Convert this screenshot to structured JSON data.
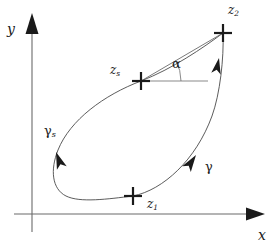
{
  "figure": {
    "background": "#ffffff",
    "ink": "#1a1a1a",
    "curve_color": "#4a4a4a"
  },
  "axes": {
    "x_label": "x",
    "y_label": "y",
    "origin": {
      "x": 32,
      "y": 214
    },
    "x_end": {
      "x": 252,
      "y": 214
    },
    "y_end": {
      "x": 32,
      "y": 18
    },
    "arrowhead": "solid-triangle"
  },
  "points": [
    {
      "id": "z1",
      "label": "z",
      "subscript": "1",
      "x": 133,
      "y": 196,
      "marker": "plus"
    },
    {
      "id": "zs",
      "label": "z",
      "subscript": "s",
      "x": 141,
      "y": 81,
      "marker": "plus"
    },
    {
      "id": "z2",
      "label": "z",
      "subscript": "2",
      "x": 223,
      "y": 33,
      "marker": "plus"
    }
  ],
  "angle": {
    "label": "α",
    "vertex": {
      "x": 141,
      "y": 81
    },
    "reference_ray_end": {
      "x": 208,
      "y": 81
    },
    "chord_end": {
      "x": 223,
      "y": 33
    },
    "arc_radius": 40
  },
  "curves": [
    {
      "id": "gamma",
      "label": "γ",
      "subscript": "",
      "description": "contour from z1 rising to z2 on the right",
      "arrow_direction": "up-right"
    },
    {
      "id": "gamma_s",
      "label": "γ",
      "subscript": "s",
      "description": "contour sweeping left and upward toward zs",
      "arrow_direction": "up-left"
    },
    {
      "id": "gamma_descent",
      "label": "",
      "subscript": "",
      "description": "right branch descending from z2",
      "arrow_direction": "up"
    }
  ],
  "labels": {
    "gamma": "γ",
    "gamma_s_base": "γ",
    "gamma_s_sub": "s",
    "alpha": "α"
  }
}
